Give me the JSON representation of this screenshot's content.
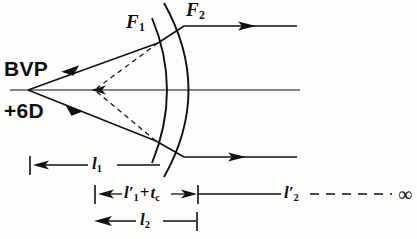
{
  "figure": {
    "type": "optics-ray-diagram",
    "background_color": "#fdfdfb",
    "ink_color": "#101010"
  },
  "labels": {
    "source_title": "BVP",
    "source_power": "+6D",
    "focal_point_1": "F",
    "focal_point_1_sub": "1",
    "focal_point_2": "F",
    "focal_point_2_sub": "2",
    "infinity": "∞"
  },
  "dimensions": [
    {
      "id": "l1",
      "base": "l",
      "sub": "1",
      "prime": "",
      "text": "l₁",
      "row": 1,
      "from_label": "source-point",
      "to_label": "first-surface-vertex"
    },
    {
      "id": "l1-prime-plus-tc",
      "base": "l",
      "sub": "1",
      "prime": "′",
      "plus": "+",
      "second_base": "t",
      "second_sub": "c",
      "text": "l′₁ + t_c",
      "row": 2,
      "from_label": "virtual-image-point",
      "to_label": "second-surface-vertex"
    },
    {
      "id": "l2-prime",
      "base": "l",
      "sub": "2",
      "prime": "′",
      "text": "l′₂",
      "row": 2,
      "from_label": "second-surface-vertex",
      "to_label": "infinity"
    },
    {
      "id": "l2",
      "base": "l",
      "sub": "2",
      "prime": "",
      "text": "l₂",
      "row": 3,
      "from_label": "virtual-image-point",
      "to_label": "second-surface-vertex"
    }
  ],
  "geometry": {
    "optical_axis": {
      "x1": 10,
      "y": 90,
      "x2": 300
    },
    "source_point": {
      "x": 28,
      "y": 90
    },
    "virtual_image_point": {
      "x": 95,
      "y": 90
    },
    "surface1": {
      "vertex_x": 172,
      "top": [
        152,
        18
      ],
      "bottom": [
        152,
        163
      ],
      "curve_x": 140
    },
    "surface2": {
      "vertex_x": 199,
      "top": [
        164,
        3
      ],
      "bottom": [
        164,
        177
      ],
      "curve_x": 148
    },
    "upper_ray": {
      "start": [
        28,
        90
      ],
      "surface1_hit": [
        158,
        43
      ],
      "surface2_hit": [
        184,
        26
      ],
      "exit_end": [
        297,
        26
      ]
    },
    "lower_ray": {
      "start": [
        28,
        90
      ],
      "surface1_hit": [
        156,
        141
      ],
      "surface2_hit": [
        184,
        157
      ],
      "exit_end": [
        297,
        157
      ]
    },
    "dim_rows": {
      "row1_y": 165,
      "row2_y": 194,
      "row3_y": 221
    },
    "dim_ticks": {
      "left_outer_x": 30,
      "mid_x": 95,
      "surface1_x": 160,
      "surface2_x": 198
    },
    "dashed_infinity": {
      "start_x": 310,
      "end_x": 392,
      "label_x": 400
    }
  }
}
